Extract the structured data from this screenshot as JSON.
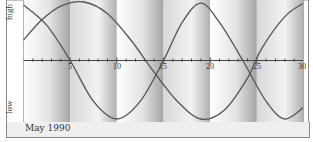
{
  "chart_data": {
    "type": "line",
    "title": "",
    "xlabel": "May 1990",
    "ylabel": "",
    "y_axis_labels": {
      "top": "high",
      "bottom": "low"
    },
    "x_ticks": [
      5,
      10,
      15,
      20,
      25,
      30
    ],
    "x_range": [
      0,
      30
    ],
    "y_range": [
      -1,
      1
    ],
    "grid": false,
    "legend": null,
    "background_bands": "alternating vertical gray gradient bands every 5 days",
    "series": [
      {
        "name": "curve-a",
        "description": "sinusoid starting slightly below midline-high, rising to peak ~day 6.5, low ~day 16, peak ~day 25",
        "x": [
          0,
          2,
          4,
          6.5,
          9,
          11.5,
          14,
          16.5,
          19,
          21.5,
          24,
          25.5,
          28,
          30
        ],
        "values": [
          0.35,
          0.7,
          0.93,
          1.0,
          0.8,
          0.35,
          -0.2,
          -0.7,
          -1.0,
          -0.85,
          -0.3,
          0.2,
          0.75,
          0.98
        ]
      },
      {
        "name": "curve-b",
        "description": "sinusoid starting near high, crossing axis ~day 5, low ~day 10, crossing ~day 15, peak ~day 19, crossing ~day 23.5, low ~day 28",
        "x": [
          0,
          2.5,
          5,
          7.5,
          10,
          12.5,
          15,
          17,
          19,
          21,
          23.5,
          26,
          28,
          30
        ],
        "values": [
          0.95,
          0.6,
          0.0,
          -0.7,
          -1.0,
          -0.7,
          0.0,
          0.65,
          0.98,
          0.65,
          0.0,
          -0.7,
          -1.0,
          -0.8
        ]
      }
    ]
  },
  "axis": {
    "high_label": "high",
    "low_label": "low",
    "ticks": [
      "5",
      "10",
      "15",
      "20",
      "25",
      "30"
    ]
  },
  "footer": {
    "month_label": "May 1990"
  },
  "colors": {
    "curve": "#555555",
    "axis": "#444444",
    "frame": "#8a8a8a",
    "band_dark": "#a8a8a8",
    "band_light": "#ffffff"
  }
}
